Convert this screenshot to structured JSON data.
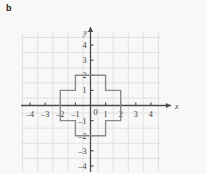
{
  "figure": {
    "panel_label": "b",
    "background_color": "#f8f8f8",
    "grid_color": "#e0e0e0",
    "axis_color": "#4a4a4a",
    "shape_color": "#8a8a8a",
    "label_color": "#3c3c3c"
  },
  "chart_data": {
    "type": "scatter",
    "title": "",
    "xlabel": "x",
    "ylabel": "y",
    "grid": true,
    "legend": null,
    "xlim": [
      -4.6,
      4.6
    ],
    "ylim": [
      -4.4,
      4.8
    ],
    "xticks": [
      -4,
      -3,
      -2,
      -1,
      1,
      2,
      3,
      4
    ],
    "yticks": [
      4,
      3,
      2,
      1,
      -1,
      -2,
      -3,
      -4
    ],
    "xtick_labels": [
      "–4",
      "–3",
      "–2",
      "–1",
      "1",
      "2",
      "3",
      "4"
    ],
    "ytick_labels": [
      "4",
      "3",
      "2",
      "1",
      "–1",
      "–2",
      "–3",
      "–4"
    ],
    "origin_label": "0",
    "annotations": [],
    "shapes": [
      {
        "name": "plus-cross-polygon",
        "kind": "polygon",
        "closed": true,
        "filled": false,
        "vertices": [
          [
            -1,
            2
          ],
          [
            1,
            2
          ],
          [
            1,
            1
          ],
          [
            2,
            1
          ],
          [
            2,
            -1
          ],
          [
            1,
            -1
          ],
          [
            1,
            -2
          ],
          [
            -1,
            -2
          ],
          [
            -1,
            -1
          ],
          [
            -2,
            -1
          ],
          [
            -2,
            1
          ],
          [
            -1,
            1
          ]
        ]
      }
    ]
  }
}
